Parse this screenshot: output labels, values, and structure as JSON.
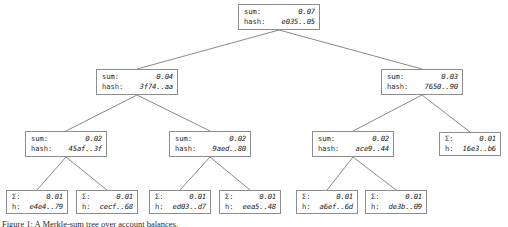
{
  "diagram": {
    "type": "merkle-sum-tree",
    "labels": {
      "sum_full": "sum:",
      "hash_full": "hash:",
      "sum_short": "Σ:",
      "hash_short": "h:"
    },
    "caption": "Figure 1: A Merkle-sum tree over account balances.",
    "colors": {
      "box_border": "#8d8d8d",
      "edge": "#7a7a7a",
      "value_text": "#161616",
      "label_text": "#2b2b2b",
      "background": "#ffffff"
    },
    "nodes": [
      {
        "id": "root",
        "style": "full",
        "sum": "0.07",
        "hash": "e035..05",
        "x": 238,
        "y": 4
      },
      {
        "id": "n-left",
        "style": "full",
        "sum": "0.04",
        "hash": "3f74..aa",
        "x": 96,
        "y": 69
      },
      {
        "id": "n-right",
        "style": "full",
        "sum": "0.03",
        "hash": "7650..90",
        "x": 381,
        "y": 69
      },
      {
        "id": "n-ll",
        "style": "full",
        "sum": "0.02",
        "hash": "45af..3f",
        "x": 25,
        "y": 131
      },
      {
        "id": "n-lr",
        "style": "full",
        "sum": "0.02",
        "hash": "9aed..80",
        "x": 169,
        "y": 131
      },
      {
        "id": "n-rl",
        "style": "full",
        "sum": "0.02",
        "hash": "ace9..44",
        "x": 312,
        "y": 131
      },
      {
        "id": "leaf-g",
        "style": "leaf",
        "sum": "0.01",
        "hash": "16e3..b6",
        "x": 439,
        "y": 132
      },
      {
        "id": "leaf-a",
        "style": "leaf",
        "sum": "0.01",
        "hash": "e4e4..79",
        "x": 6,
        "y": 190
      },
      {
        "id": "leaf-b",
        "style": "leaf",
        "sum": "0.01",
        "hash": "cecf..68",
        "x": 76,
        "y": 190
      },
      {
        "id": "leaf-c",
        "style": "leaf",
        "sum": "0.01",
        "hash": "ed03..d7",
        "x": 149,
        "y": 190
      },
      {
        "id": "leaf-d",
        "style": "leaf",
        "sum": "0.01",
        "hash": "eea5..48",
        "x": 219,
        "y": 190
      },
      {
        "id": "leaf-e",
        "style": "leaf",
        "sum": "0.01",
        "hash": "a6ef..6d",
        "x": 296,
        "y": 190
      },
      {
        "id": "leaf-f",
        "style": "leaf",
        "sum": "0.01",
        "hash": "de3b..09",
        "x": 365,
        "y": 190
      }
    ],
    "edges": [
      {
        "from": "root",
        "to": "n-left"
      },
      {
        "from": "root",
        "to": "n-right"
      },
      {
        "from": "n-left",
        "to": "n-ll"
      },
      {
        "from": "n-left",
        "to": "n-lr"
      },
      {
        "from": "n-right",
        "to": "n-rl"
      },
      {
        "from": "n-right",
        "to": "leaf-g"
      },
      {
        "from": "n-ll",
        "to": "leaf-a"
      },
      {
        "from": "n-ll",
        "to": "leaf-b"
      },
      {
        "from": "n-lr",
        "to": "leaf-c"
      },
      {
        "from": "n-lr",
        "to": "leaf-d"
      },
      {
        "from": "n-rl",
        "to": "leaf-e"
      },
      {
        "from": "n-rl",
        "to": "leaf-f"
      }
    ]
  }
}
